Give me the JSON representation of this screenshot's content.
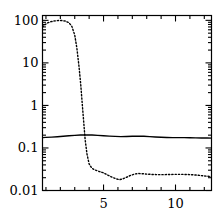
{
  "chart_data": {
    "type": "line",
    "title": "",
    "xlabel": "",
    "ylabel": "",
    "xscale": "linear",
    "yscale": "log",
    "xlim": [
      0.76,
      12.5
    ],
    "ylim": [
      0.01,
      130
    ],
    "grid": false,
    "legend": null,
    "axis": {
      "x_major_ticks": [
        5,
        10
      ],
      "x_major_tick_labels": [
        "5",
        "10"
      ],
      "x_minor_ticks": [
        1,
        2,
        3,
        4,
        6,
        7,
        8,
        9,
        11,
        12
      ],
      "y_major_ticks": [
        0.01,
        0.1,
        1,
        10,
        100
      ],
      "y_major_tick_labels": [
        "0.01",
        "0.1",
        "1",
        "10",
        "100"
      ],
      "ticks_direction": "in",
      "frame": "box"
    },
    "series": [
      {
        "name": "solid-curve",
        "style": "solid",
        "color": "#000000",
        "linewidth": 1.4,
        "x": [
          0.76,
          1.0,
          1.4,
          1.8,
          2.2,
          2.6,
          3.0,
          3.4,
          3.8,
          4.2,
          4.6,
          5.0,
          5.4,
          5.8,
          6.2,
          6.6,
          7.0,
          7.4,
          7.8,
          8.2,
          8.6,
          9.0,
          9.4,
          9.8,
          10.2,
          10.6,
          11.0,
          11.4,
          11.8,
          12.2,
          12.5
        ],
        "y": [
          0.175,
          0.177,
          0.18,
          0.184,
          0.189,
          0.194,
          0.198,
          0.201,
          0.202,
          0.201,
          0.198,
          0.194,
          0.19,
          0.187,
          0.185,
          0.186,
          0.188,
          0.189,
          0.188,
          0.185,
          0.181,
          0.178,
          0.176,
          0.175,
          0.175,
          0.175,
          0.174,
          0.173,
          0.172,
          0.171,
          0.17
        ]
      },
      {
        "name": "dotted-curve",
        "style": "dotted",
        "color": "#000000",
        "linewidth": 1.4,
        "x": [
          0.76,
          0.95,
          1.15,
          1.35,
          1.6,
          1.85,
          2.1,
          2.35,
          2.6,
          2.8,
          3.0,
          3.15,
          3.3,
          3.42,
          3.52,
          3.62,
          3.72,
          3.85,
          4.0,
          4.2,
          4.45,
          4.7,
          5.0,
          5.3,
          5.6,
          5.9,
          6.1,
          6.35,
          6.6,
          6.9,
          7.2,
          7.45,
          7.7,
          8.0,
          8.4,
          8.8,
          9.2,
          9.6,
          10.0,
          10.4,
          10.8,
          11.2,
          11.6,
          12.0,
          12.5
        ],
        "y": [
          70,
          80,
          88,
          93,
          97,
          99,
          99,
          96,
          88,
          72,
          45,
          22,
          8.0,
          3.0,
          1.1,
          0.42,
          0.16,
          0.072,
          0.042,
          0.033,
          0.03,
          0.028,
          0.026,
          0.023,
          0.0205,
          0.0187,
          0.018,
          0.0188,
          0.0205,
          0.0228,
          0.0245,
          0.025,
          0.0248,
          0.0243,
          0.0238,
          0.0236,
          0.0236,
          0.0238,
          0.024,
          0.024,
          0.0238,
          0.0234,
          0.0228,
          0.022,
          0.0212
        ]
      }
    ]
  },
  "ytick_labels": [
    {
      "text": "100",
      "value": 100
    },
    {
      "text": "10",
      "value": 10
    },
    {
      "text": "1",
      "value": 1
    },
    {
      "text": "0.1",
      "value": 0.1
    },
    {
      "text": "0.01",
      "value": 0.01
    }
  ],
  "xtick_labels": [
    {
      "text": "5",
      "value": 5
    },
    {
      "text": "10",
      "value": 10
    }
  ]
}
